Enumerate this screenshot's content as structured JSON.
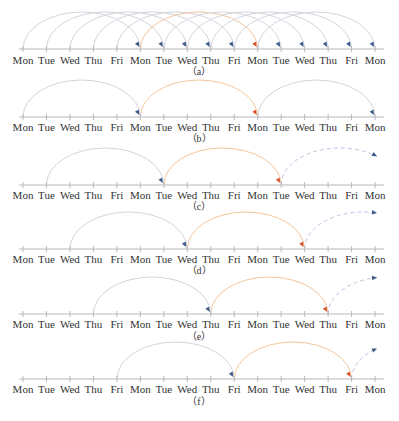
{
  "colors": {
    "axis": "#b8b8c0",
    "arc": "#d4d4de",
    "arc_highlight": "#f2c79e",
    "arrow_blue": "#3d5a88",
    "arrow_orange": "#d9532a",
    "dashed": "#b9c6e0",
    "label": "#333333"
  },
  "axis": {
    "x_start": 23,
    "x_step": 23.47,
    "line_from": 19,
    "line_to": 384,
    "arc_height": 37
  },
  "panels": [
    {
      "id": "a",
      "caption": "（a）",
      "axis_y": 49,
      "label_y": 64,
      "caption_y": 75,
      "ticks": [
        "Mon",
        "Tue",
        "Wed",
        "Thu",
        "Fri",
        "Mon",
        "Tue",
        "Wed",
        "Thu",
        "Fri",
        "Mon",
        "Tue",
        "Wed",
        "Thu",
        "Fri",
        "Mon"
      ],
      "arcs": [
        {
          "from": 0,
          "to": 5,
          "style": "normal"
        },
        {
          "from": 1,
          "to": 6,
          "style": "normal"
        },
        {
          "from": 2,
          "to": 7,
          "style": "normal"
        },
        {
          "from": 3,
          "to": 8,
          "style": "normal"
        },
        {
          "from": 4,
          "to": 9,
          "style": "normal"
        },
        {
          "from": 5,
          "to": 10,
          "style": "highlight"
        },
        {
          "from": 6,
          "to": 11,
          "style": "normal"
        },
        {
          "from": 7,
          "to": 12,
          "style": "normal"
        },
        {
          "from": 8,
          "to": 13,
          "style": "normal"
        },
        {
          "from": 9,
          "to": 14,
          "style": "normal"
        },
        {
          "from": 10,
          "to": 15,
          "style": "normal"
        }
      ]
    },
    {
      "id": "b",
      "caption": "（b）",
      "axis_y": 117,
      "label_y": 131,
      "caption_y": 142,
      "ticks": [
        "Mon",
        "Tue",
        "Wed",
        "Thu",
        "Fri",
        "Mon",
        "Tue",
        "Wed",
        "Thu",
        "Fri",
        "Mon",
        "Tue",
        "Wed",
        "Thu",
        "Fri",
        "Mon"
      ],
      "arcs": [
        {
          "from": 0,
          "to": 5,
          "style": "normal"
        },
        {
          "from": 5,
          "to": 10,
          "style": "highlight"
        },
        {
          "from": 10,
          "to": 15,
          "style": "normal"
        }
      ]
    },
    {
      "id": "c",
      "caption": "（c）",
      "axis_y": 185,
      "label_y": 199,
      "caption_y": 210,
      "ticks": [
        "Mon",
        "Tue",
        "Wed",
        "Thu",
        "Fri",
        "Mon",
        "Tue",
        "Wed",
        "Thu",
        "Fri",
        "Mon",
        "Tue",
        "Wed",
        "Thu",
        "Fri",
        "Mon"
      ],
      "arcs": [
        {
          "from": 1,
          "to": 6,
          "style": "normal"
        },
        {
          "from": 6,
          "to": 11,
          "style": "highlight"
        },
        {
          "from": 11,
          "to": 16,
          "style": "dashed",
          "clip_x": 377
        }
      ]
    },
    {
      "id": "d",
      "caption": "（d）",
      "axis_y": 249,
      "label_y": 263,
      "caption_y": 274,
      "ticks": [
        "Mon",
        "Tue",
        "Wed",
        "Thu",
        "Fri",
        "Mon",
        "Tue",
        "Wed",
        "Thu",
        "Fri",
        "Mon",
        "Tue",
        "Wed",
        "Thu",
        "Fri",
        "Mon"
      ],
      "arcs": [
        {
          "from": 2,
          "to": 7,
          "style": "normal"
        },
        {
          "from": 7,
          "to": 12,
          "style": "highlight"
        },
        {
          "from": 12,
          "to": 17,
          "style": "dashed",
          "clip_x": 377
        }
      ]
    },
    {
      "id": "e",
      "caption": "（e）",
      "axis_y": 314,
      "label_y": 328,
      "caption_y": 340,
      "ticks": [
        "Mon",
        "Tue",
        "Wed",
        "Thu",
        "Fri",
        "Mon",
        "Tue",
        "Wed",
        "Thu",
        "Fri",
        "Mon",
        "Tue",
        "Wed",
        "Thu",
        "Fri",
        "Mon"
      ],
      "arcs": [
        {
          "from": 3,
          "to": 8,
          "style": "normal"
        },
        {
          "from": 8,
          "to": 13,
          "style": "highlight"
        },
        {
          "from": 13,
          "to": 18,
          "style": "dashed",
          "clip_x": 377
        }
      ]
    },
    {
      "id": "f",
      "caption": "（f）",
      "axis_y": 379,
      "label_y": 393,
      "caption_y": 405,
      "ticks": [
        "Mon",
        "Tue",
        "Wed",
        "Thu",
        "Fri",
        "Mon",
        "Tue",
        "Wed",
        "Thu",
        "Fri",
        "Mon",
        "Tue",
        "Wed",
        "Thu",
        "Fri",
        "Mon"
      ],
      "arcs": [
        {
          "from": 4,
          "to": 9,
          "style": "normal"
        },
        {
          "from": 9,
          "to": 14,
          "style": "highlight"
        },
        {
          "from": 14,
          "to": 19,
          "style": "dashed",
          "clip_x": 377
        }
      ]
    }
  ]
}
